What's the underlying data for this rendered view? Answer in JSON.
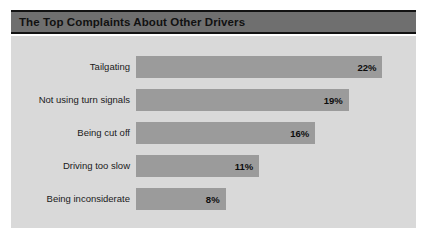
{
  "chart_data": {
    "type": "bar",
    "orientation": "horizontal",
    "title": "The Top Complaints About Other Drivers",
    "xlabel": "",
    "ylabel": "",
    "categories": [
      "Tailgating",
      "Not using turn signals",
      "Being cut off",
      "Driving too slow",
      "Being inconsiderate"
    ],
    "values": [
      22,
      19,
      16,
      11,
      8
    ],
    "value_labels": [
      "22%",
      "19%",
      "16%",
      "11%",
      "8%"
    ],
    "xlim": [
      0,
      25
    ],
    "grid": false,
    "legend": false,
    "bars": [
      {
        "label": "Tailgating",
        "value": 22,
        "value_label": "22%"
      },
      {
        "label": "Not using turn signals",
        "value": 19,
        "value_label": "19%"
      },
      {
        "label": "Being cut off",
        "value": 16,
        "value_label": "16%"
      },
      {
        "label": "Driving too slow",
        "value": 11,
        "value_label": "11%"
      },
      {
        "label": "Being inconsiderate",
        "value": 8,
        "value_label": "8%"
      }
    ]
  },
  "colors": {
    "title_band": "#6f6f6f",
    "title_rule": "#121212",
    "panel_background": "#d9d9d9",
    "bar_fill": "#9b9b9b",
    "label_text": "#1a1a1a",
    "value_text": "#0d0d0d",
    "page_background": "#ffffff"
  }
}
